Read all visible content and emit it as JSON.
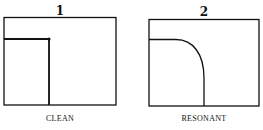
{
  "panels": [
    {
      "number": "1",
      "label": "CLEAN"
    },
    {
      "number": "2",
      "label": "RESONANT"
    }
  ],
  "colors": {
    "line": "#111111",
    "background": "#ffffff"
  }
}
